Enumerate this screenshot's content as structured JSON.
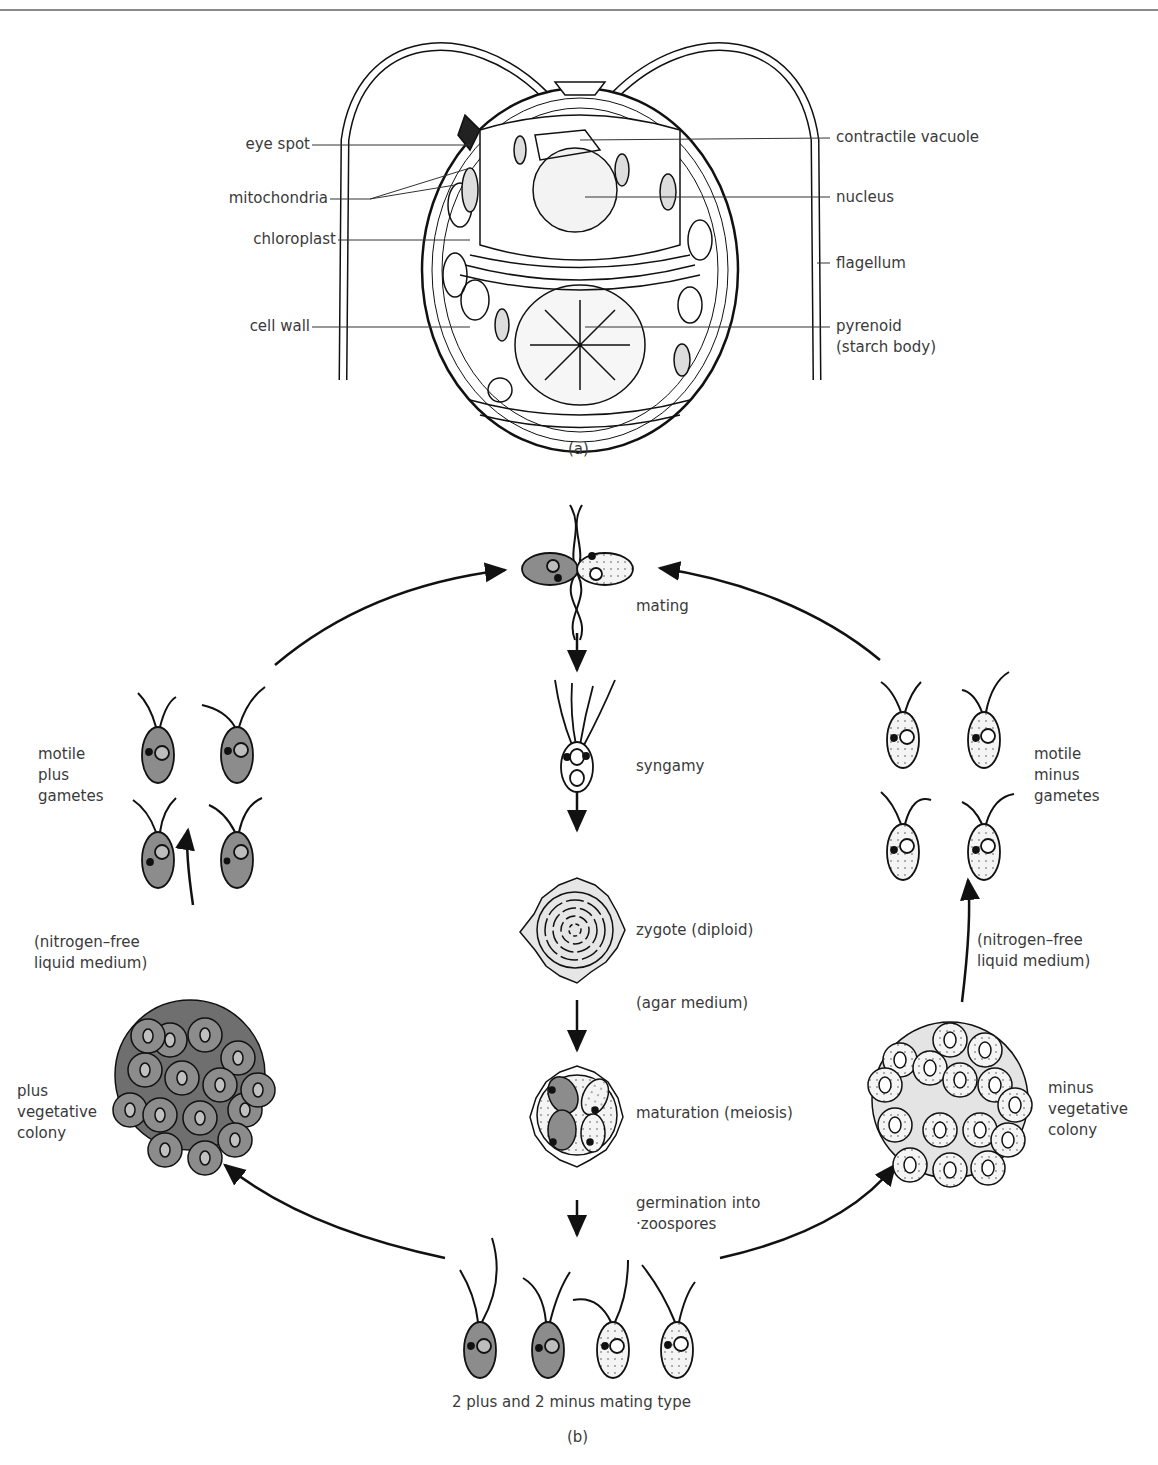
{
  "figure_a": {
    "caption": "(a)",
    "labels_left": [
      "eye spot",
      "mitochondria",
      "chloroplast",
      "cell wall"
    ],
    "labels_right": [
      "contractile vacuole",
      "nucleus",
      "flagellum",
      "pyrenoid\n(starch body)"
    ]
  },
  "figure_b": {
    "caption": "(b)",
    "stages": {
      "mating": "mating",
      "syngamy": "syngamy",
      "zygote": "zygote (diploid)",
      "agar": "(agar medium)",
      "maturation": "maturation (meiosis)",
      "germination": "germination into\n·zoospores",
      "zoospores": "2 plus and 2 minus mating type"
    },
    "left": {
      "gametes": "motile\nplus\ngametes",
      "medium": "(nitrogen–free\nliquid medium)",
      "colony": "plus\nvegetative\ncolony"
    },
    "right": {
      "gametes": "motile\nminus\ngametes",
      "medium": "(nitrogen–free\nliquid medium)",
      "colony": "minus\nvegetative\ncolony"
    }
  },
  "colors": {
    "plus_fill": "#8c8c8c",
    "minus_fill": "#f2f2f2",
    "ink": "#111111"
  }
}
